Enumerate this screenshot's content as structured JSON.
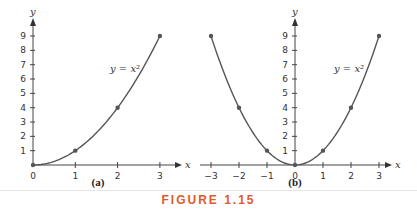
{
  "figure": {
    "caption": "FIGURE 1.15",
    "caption_color": "#e05a2a",
    "curve_color": "#555555"
  },
  "chart_data": [
    {
      "type": "line",
      "title": "(a)",
      "equation_label": "y = x²",
      "xlabel": "x",
      "ylabel": "y",
      "x": [
        0,
        1,
        2,
        3
      ],
      "y": [
        0,
        1,
        4,
        9
      ],
      "marked_points": [
        [
          0,
          0
        ],
        [
          1,
          1
        ],
        [
          2,
          4
        ],
        [
          3,
          9
        ]
      ],
      "xlim": [
        0,
        3
      ],
      "ylim": [
        0,
        9
      ],
      "x_ticks": [
        "0",
        "1",
        "2",
        "3"
      ],
      "y_ticks": [
        "1",
        "2",
        "3",
        "4",
        "5",
        "6",
        "7",
        "8",
        "9"
      ],
      "grid": false
    },
    {
      "type": "line",
      "title": "(b)",
      "equation_label": "y = x²",
      "xlabel": "x",
      "ylabel": "y",
      "x": [
        -3,
        -2,
        -1,
        0,
        1,
        2,
        3
      ],
      "y": [
        9,
        4,
        1,
        0,
        1,
        4,
        9
      ],
      "marked_points": [
        [
          -3,
          9
        ],
        [
          -2,
          4
        ],
        [
          -1,
          1
        ],
        [
          0,
          0
        ],
        [
          1,
          1
        ],
        [
          2,
          4
        ],
        [
          3,
          9
        ]
      ],
      "xlim": [
        -3,
        3
      ],
      "ylim": [
        0,
        9
      ],
      "x_ticks": [
        "−3",
        "−2",
        "−1",
        "0",
        "1",
        "2",
        "3"
      ],
      "y_ticks": [
        "1",
        "2",
        "3",
        "4",
        "5",
        "6",
        "7",
        "8",
        "9"
      ],
      "grid": false
    }
  ]
}
